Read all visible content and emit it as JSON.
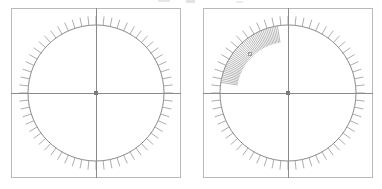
{
  "figure": {
    "type": "polar-tick-diagram-pair",
    "background_color": "#ffffff",
    "width": 382,
    "height": 189,
    "panel_count": 2,
    "caption": ""
  },
  "style": {
    "frame_color": "#b9b9b9",
    "frame_width": 1,
    "circle_color": "#8c8c8c",
    "circle_width": 1,
    "axis_color": "#8a8a8a",
    "axis_width": 1,
    "tick_color": "#8a8a8a",
    "tick_width": 0.7,
    "dense_tick_color": "#9a9a9a",
    "center_dot_color": "#7a7a7a",
    "marker_color": "#9a9a9a"
  },
  "panels": [
    {
      "id": "panel-left",
      "name": "left-polar-panel",
      "label": "",
      "frame": {
        "x": 11,
        "y": 8,
        "width": 170,
        "height": 170
      },
      "center": {
        "x": 85,
        "y": 85
      },
      "circle_radius": 68,
      "center_dot_size": 4,
      "axes": {
        "horizontal": true,
        "vertical": true
      },
      "tick_set": {
        "count": 60,
        "direction": "outward",
        "length": 9,
        "start_angle_deg": 0,
        "step_deg": 6
      },
      "dense_cluster": null,
      "marker": null
    },
    {
      "id": "panel-right",
      "name": "right-polar-panel",
      "label": "",
      "frame": {
        "x": 203,
        "y": 8,
        "width": 170,
        "height": 170
      },
      "center": {
        "x": 85,
        "y": 85
      },
      "circle_radius": 68,
      "center_dot_size": 4,
      "axes": {
        "horizontal": true,
        "vertical": true
      },
      "tick_set": {
        "count": 60,
        "direction": "outward",
        "length": 9,
        "start_angle_deg": 0,
        "step_deg": 6
      },
      "dense_cluster": {
        "count": 46,
        "direction": "inward",
        "length": 17,
        "start_angle_deg": 99,
        "end_angle_deg": 171
      },
      "marker": {
        "name": "small-square-marker",
        "x": 47,
        "y": 46,
        "size": 3,
        "shape": "square"
      }
    }
  ]
}
